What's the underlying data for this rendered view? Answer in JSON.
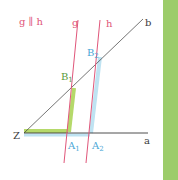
{
  "diagram": {
    "caption": "g ∥ h",
    "lines": {
      "g": {
        "label": "g",
        "color": "#e0567a"
      },
      "h": {
        "label": "h",
        "color": "#e0567a"
      },
      "a": {
        "label": "a",
        "color": "#3a3a3a"
      },
      "b": {
        "label": "b",
        "color": "#3a3a3a"
      }
    },
    "points": {
      "Z": {
        "label": "Z"
      },
      "A1": {
        "label": "A",
        "sub": "1"
      },
      "A2": {
        "label": "A",
        "sub": "2"
      },
      "B1": {
        "label": "B",
        "sub": "1"
      },
      "B2": {
        "label": "B",
        "sub": "2"
      }
    },
    "colors": {
      "caption": "#e0567a",
      "green_highlight": "#b5d96a",
      "green_label": "#5a9a3a",
      "blue_highlight": "#bfe3f2",
      "blue_label": "#4aa6d6",
      "side_band": "#9ccc6a"
    }
  }
}
